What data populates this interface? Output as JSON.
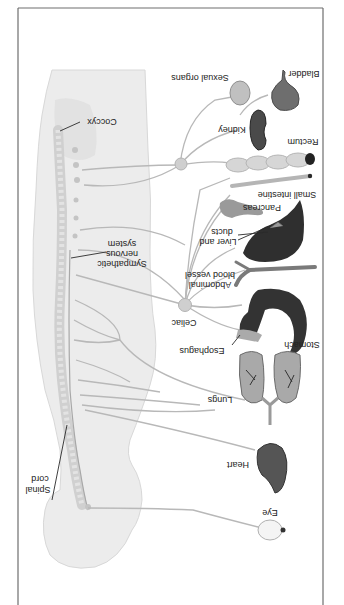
{
  "figure": {
    "orientation": "rotated 180 degrees",
    "colors": {
      "frame": "#6e6e6e",
      "body_fill": "#e9e9e9",
      "body_outline": "#d6d6d6",
      "spine": "#d2d2d2",
      "nerve": "#b8b8b8",
      "ganglion": "#c9c9c9",
      "organ_dark": "#2e2e2e",
      "organ_mid": "#7a7a7a",
      "organ_light": "#bdbdbd",
      "label": "#222222"
    }
  },
  "labels": {
    "coccyx": "Coccyx",
    "sympathetic_1": "Sympathetic",
    "sympathetic_2": "nervous",
    "sympathetic_3": "system",
    "spinal_1": "Spinal",
    "spinal_2": "cord",
    "celiac": "Celiac",
    "sexual_organs": "Sexual organs",
    "bladder": "Bladder",
    "kidney": "Kidney",
    "rectum": "Rectum",
    "small_intestine": "Small intestine",
    "pancreas": "Pancreas",
    "liver_1": "Liver and",
    "liver_2": "ducts",
    "abdominal_1": "Abdominal",
    "abdominal_2": "blood vessel",
    "stomach": "Stomach",
    "esophagus": "Esophagus",
    "lungs": "Lungs",
    "heart": "Heart",
    "eye": "Eye"
  }
}
